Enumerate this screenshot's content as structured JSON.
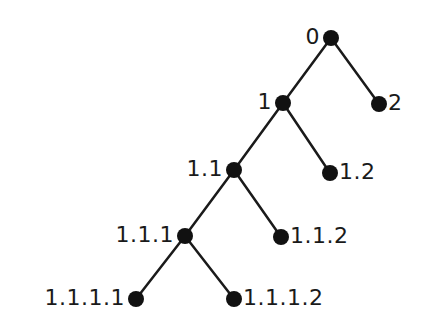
{
  "diagram": {
    "type": "tree",
    "colors": {
      "edge": "#1a1a1a",
      "node": "#111111",
      "text": "#1a1a1a",
      "background": "#ffffff"
    },
    "nodes": [
      {
        "id": "0",
        "label": "0",
        "x": 331,
        "y": 38,
        "label_side": "left"
      },
      {
        "id": "1",
        "label": "1",
        "x": 283,
        "y": 103,
        "label_side": "left"
      },
      {
        "id": "2",
        "label": "2",
        "x": 379,
        "y": 104,
        "label_side": "right"
      },
      {
        "id": "1.1",
        "label": "1.1",
        "x": 234,
        "y": 170,
        "label_side": "left"
      },
      {
        "id": "1.2",
        "label": "1.2",
        "x": 330,
        "y": 173,
        "label_side": "right"
      },
      {
        "id": "1.1.1",
        "label": "1.1.1",
        "x": 185,
        "y": 236,
        "label_side": "left"
      },
      {
        "id": "1.1.2",
        "label": "1.1.2",
        "x": 281,
        "y": 237,
        "label_side": "right"
      },
      {
        "id": "1.1.1.1",
        "label": "1.1.1.1",
        "x": 136,
        "y": 299,
        "label_side": "left"
      },
      {
        "id": "1.1.1.2",
        "label": "1.1.1.2",
        "x": 234,
        "y": 299,
        "label_side": "right"
      }
    ],
    "edges": [
      [
        "0",
        "1"
      ],
      [
        "0",
        "2"
      ],
      [
        "1",
        "1.1"
      ],
      [
        "1",
        "1.2"
      ],
      [
        "1.1",
        "1.1.1"
      ],
      [
        "1.1",
        "1.1.2"
      ],
      [
        "1.1.1",
        "1.1.1.1"
      ],
      [
        "1.1.1",
        "1.1.1.2"
      ]
    ]
  }
}
